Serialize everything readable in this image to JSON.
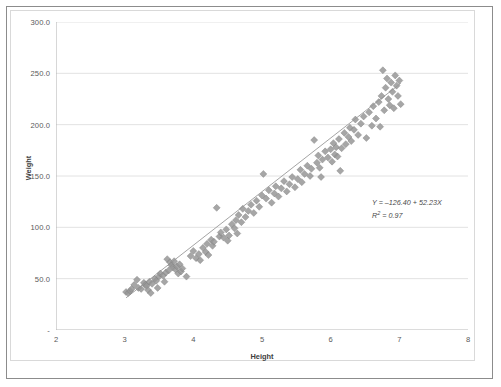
{
  "chart_data": {
    "type": "scatter",
    "title": "",
    "xlabel": "Height",
    "ylabel": "Weight",
    "xlim": [
      2,
      8
    ],
    "ylim": [
      0,
      300
    ],
    "xticks": [
      "2",
      "3",
      "4",
      "5",
      "6",
      "7",
      "8"
    ],
    "yticks": [
      "-",
      "50.0",
      "100.0",
      "150.0",
      "200.0",
      "250.0",
      "300.0"
    ],
    "ytick_values": [
      0,
      50,
      100,
      150,
      200,
      250,
      300
    ],
    "xtick_values": [
      2,
      3,
      4,
      5,
      6,
      7,
      8
    ],
    "grid": "horizontal",
    "legend": "none",
    "marker": "diamond",
    "marker_color": "#969696",
    "trendline": {
      "type": "linear",
      "intercept": -126.4,
      "slope": 52.23,
      "r_squared": 0.97,
      "color": "#9a9a9a"
    },
    "annotations": {
      "equation": "Y = –126.40 + 52.23X",
      "equation_prefix": "Y = –126.40 + 52.23",
      "equation_variable": "X",
      "r2_prefix": "R",
      "r2_exponent": "2",
      "r2_value": " = 0.97"
    },
    "points": [
      [
        3.02,
        37
      ],
      [
        3.05,
        36
      ],
      [
        3.08,
        38
      ],
      [
        3.1,
        40
      ],
      [
        3.14,
        44
      ],
      [
        3.18,
        49
      ],
      [
        3.2,
        41
      ],
      [
        3.24,
        40
      ],
      [
        3.28,
        46
      ],
      [
        3.3,
        44
      ],
      [
        3.32,
        43
      ],
      [
        3.34,
        39
      ],
      [
        3.36,
        47
      ],
      [
        3.38,
        36
      ],
      [
        3.4,
        45
      ],
      [
        3.44,
        50
      ],
      [
        3.46,
        48
      ],
      [
        3.48,
        41
      ],
      [
        3.5,
        52
      ],
      [
        3.52,
        55
      ],
      [
        3.56,
        53
      ],
      [
        3.58,
        47
      ],
      [
        3.6,
        56
      ],
      [
        3.62,
        69
      ],
      [
        3.64,
        58
      ],
      [
        3.66,
        66
      ],
      [
        3.68,
        63
      ],
      [
        3.7,
        61
      ],
      [
        3.72,
        67
      ],
      [
        3.74,
        59
      ],
      [
        3.76,
        62
      ],
      [
        3.78,
        55
      ],
      [
        3.8,
        64
      ],
      [
        3.82,
        57
      ],
      [
        3.84,
        60
      ],
      [
        3.9,
        52
      ],
      [
        3.96,
        72
      ],
      [
        4.0,
        77
      ],
      [
        4.04,
        70
      ],
      [
        4.08,
        74
      ],
      [
        4.1,
        68
      ],
      [
        4.14,
        80
      ],
      [
        4.18,
        76
      ],
      [
        4.2,
        84
      ],
      [
        4.22,
        73
      ],
      [
        4.26,
        88
      ],
      [
        4.28,
        82
      ],
      [
        4.3,
        86
      ],
      [
        4.34,
        119
      ],
      [
        4.38,
        91
      ],
      [
        4.4,
        95
      ],
      [
        4.44,
        90
      ],
      [
        4.48,
        98
      ],
      [
        4.5,
        87
      ],
      [
        4.52,
        92
      ],
      [
        4.56,
        103
      ],
      [
        4.6,
        99
      ],
      [
        4.62,
        107
      ],
      [
        4.64,
        94
      ],
      [
        4.66,
        112
      ],
      [
        4.7,
        105
      ],
      [
        4.72,
        118
      ],
      [
        4.76,
        110
      ],
      [
        4.8,
        116
      ],
      [
        4.84,
        122
      ],
      [
        4.88,
        114
      ],
      [
        4.92,
        126
      ],
      [
        4.96,
        120
      ],
      [
        5.0,
        131
      ],
      [
        5.02,
        152
      ],
      [
        5.06,
        128
      ],
      [
        5.1,
        136
      ],
      [
        5.14,
        124
      ],
      [
        5.18,
        133
      ],
      [
        5.2,
        140
      ],
      [
        5.24,
        130
      ],
      [
        5.28,
        138
      ],
      [
        5.32,
        145
      ],
      [
        5.36,
        135
      ],
      [
        5.4,
        142
      ],
      [
        5.44,
        149
      ],
      [
        5.48,
        139
      ],
      [
        5.52,
        147
      ],
      [
        5.56,
        156
      ],
      [
        5.58,
        144
      ],
      [
        5.62,
        152
      ],
      [
        5.66,
        160
      ],
      [
        5.7,
        150
      ],
      [
        5.72,
        157
      ],
      [
        5.76,
        185
      ],
      [
        5.8,
        163
      ],
      [
        5.82,
        170
      ],
      [
        5.84,
        158
      ],
      [
        5.86,
        149
      ],
      [
        5.88,
        166
      ],
      [
        5.92,
        174
      ],
      [
        5.96,
        168
      ],
      [
        6.0,
        176
      ],
      [
        6.02,
        164
      ],
      [
        6.04,
        182
      ],
      [
        6.06,
        171
      ],
      [
        6.08,
        178
      ],
      [
        6.1,
        169
      ],
      [
        6.12,
        186
      ],
      [
        6.14,
        155
      ],
      [
        6.16,
        177
      ],
      [
        6.2,
        192
      ],
      [
        6.22,
        181
      ],
      [
        6.26,
        188
      ],
      [
        6.28,
        197
      ],
      [
        6.3,
        184
      ],
      [
        6.34,
        195
      ],
      [
        6.36,
        205
      ],
      [
        6.4,
        190
      ],
      [
        6.44,
        201
      ],
      [
        6.48,
        208
      ],
      [
        6.52,
        187
      ],
      [
        6.56,
        212
      ],
      [
        6.6,
        199
      ],
      [
        6.62,
        218
      ],
      [
        6.66,
        206
      ],
      [
        6.7,
        222
      ],
      [
        6.72,
        198
      ],
      [
        6.74,
        228
      ],
      [
        6.76,
        253
      ],
      [
        6.78,
        214
      ],
      [
        6.8,
        236
      ],
      [
        6.82,
        245
      ],
      [
        6.84,
        225
      ],
      [
        6.86,
        219
      ],
      [
        6.88,
        241
      ],
      [
        6.9,
        232
      ],
      [
        6.92,
        216
      ],
      [
        6.94,
        248
      ],
      [
        6.96,
        238
      ],
      [
        6.98,
        228
      ],
      [
        7.0,
        243
      ],
      [
        7.02,
        220
      ]
    ]
  }
}
